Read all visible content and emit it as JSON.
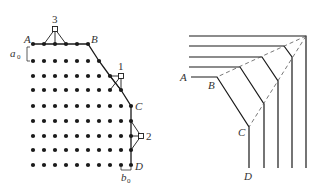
{
  "colors": {
    "ink": "#1a1a1a",
    "label": "#333333",
    "background": "#ffffff"
  },
  "left_figure": {
    "description": "crystal lattice with boundary A-B-C-D and defects",
    "grid": {
      "col_x": [
        33,
        44,
        55,
        66,
        77,
        88,
        99,
        110,
        121,
        131
      ],
      "row_y": [
        44,
        61,
        76,
        90,
        106,
        121,
        136,
        150,
        165
      ],
      "row_counts": [
        6,
        7,
        8,
        9,
        10,
        10,
        10,
        10,
        10
      ]
    },
    "points": {
      "A": {
        "label": "A",
        "x": 33,
        "y": 44
      },
      "B": {
        "label": "B",
        "x": 88,
        "y": 44
      },
      "C": {
        "label": "C",
        "x": 131,
        "y": 106
      },
      "D": {
        "label": "D",
        "x": 131,
        "y": 165
      }
    },
    "defects": [
      {
        "label": "1",
        "x": 121,
        "y": 76
      },
      {
        "label": "2",
        "x": 141,
        "y": 136
      },
      {
        "label": "3",
        "x": 55,
        "y": 29
      }
    ],
    "spacing_labels": {
      "a": {
        "main": "a",
        "sub": "0"
      },
      "b": {
        "main": "b",
        "sub": "0"
      }
    }
  },
  "right_figure": {
    "description": "nested bent lines with dashed diagonals from corner",
    "labels": {
      "A": "A",
      "B": "B",
      "C": "C",
      "D": "D"
    },
    "corner": {
      "x": 306,
      "y": 36
    },
    "lines": [
      {
        "y": 36,
        "bend_x": 306,
        "vert_x": 306,
        "vert_y": 36
      },
      {
        "y": 46,
        "bend_x": 284,
        "vert_x": 292,
        "vert_y": 57
      },
      {
        "y": 57,
        "bend_x": 262,
        "vert_x": 278,
        "vert_y": 81
      },
      {
        "y": 67,
        "bend_x": 240,
        "vert_x": 264,
        "vert_y": 104
      },
      {
        "y": 77,
        "bend_x": 217,
        "vert_x": 249,
        "vert_y": 127
      }
    ]
  }
}
